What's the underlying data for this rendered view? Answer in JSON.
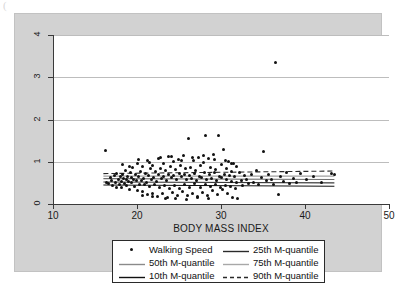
{
  "artifact_glyph": "(",
  "chart_data": {
    "type": "scatter",
    "title": "",
    "xlabel": "BODY MASS INDEX",
    "ylabel": "",
    "xlim": [
      10,
      50
    ],
    "ylim": [
      0,
      4
    ],
    "xticks": [
      10,
      20,
      30,
      40,
      50
    ],
    "yticks": [
      0,
      1,
      2,
      3,
      4
    ],
    "grid": "horizontal",
    "legend_position": "below-axes",
    "series": [
      {
        "name": "Walking Speed",
        "type": "scatter",
        "marker": "circle",
        "color": "#111111",
        "points": [
          [
            16.2,
            1.26
          ],
          [
            16.4,
            0.52
          ],
          [
            16.6,
            0.48
          ],
          [
            16.8,
            0.63
          ],
          [
            17.0,
            0.55
          ],
          [
            17.1,
            0.44
          ],
          [
            17.3,
            0.68
          ],
          [
            17.4,
            0.51
          ],
          [
            17.5,
            0.4
          ],
          [
            17.6,
            0.73
          ],
          [
            17.8,
            0.58
          ],
          [
            17.9,
            0.47
          ],
          [
            18.0,
            0.66
          ],
          [
            18.1,
            0.54
          ],
          [
            18.2,
            0.38
          ],
          [
            18.3,
            0.71
          ],
          [
            18.4,
            0.6
          ],
          [
            18.5,
            0.49
          ],
          [
            18.6,
            0.8
          ],
          [
            18.7,
            0.57
          ],
          [
            18.8,
            0.44
          ],
          [
            18.9,
            0.65
          ],
          [
            19.0,
            0.53
          ],
          [
            19.1,
            0.35
          ],
          [
            19.2,
            0.75
          ],
          [
            19.3,
            0.62
          ],
          [
            19.4,
            0.5
          ],
          [
            19.5,
            0.86
          ],
          [
            19.6,
            0.59
          ],
          [
            19.7,
            0.42
          ],
          [
            19.8,
            0.7
          ],
          [
            19.9,
            0.56
          ],
          [
            20.0,
            0.33
          ],
          [
            20.1,
            0.95
          ],
          [
            20.2,
            0.64
          ],
          [
            20.3,
            0.47
          ],
          [
            20.4,
            0.78
          ],
          [
            20.5,
            0.55
          ],
          [
            20.6,
            0.29
          ],
          [
            20.7,
            0.88
          ],
          [
            20.8,
            0.61
          ],
          [
            20.9,
            0.45
          ],
          [
            21.0,
            0.72
          ],
          [
            21.1,
            0.52
          ],
          [
            21.2,
            0.22
          ],
          [
            21.3,
            1.02
          ],
          [
            21.4,
            0.67
          ],
          [
            21.5,
            0.41
          ],
          [
            21.6,
            0.83
          ],
          [
            21.7,
            0.58
          ],
          [
            21.8,
            0.26
          ],
          [
            21.9,
            0.91
          ],
          [
            22.0,
            0.63
          ],
          [
            22.1,
            0.46
          ],
          [
            22.2,
            0.76
          ],
          [
            22.3,
            0.54
          ],
          [
            22.4,
            0.18
          ],
          [
            22.5,
            1.08
          ],
          [
            22.6,
            0.69
          ],
          [
            22.7,
            0.39
          ],
          [
            22.8,
            0.85
          ],
          [
            22.9,
            0.6
          ],
          [
            23.0,
            0.24
          ],
          [
            23.1,
            0.97
          ],
          [
            23.2,
            0.66
          ],
          [
            23.3,
            0.43
          ],
          [
            23.4,
            0.79
          ],
          [
            23.5,
            0.56
          ],
          [
            23.6,
            0.15
          ],
          [
            23.7,
            1.12
          ],
          [
            23.8,
            0.71
          ],
          [
            23.9,
            0.37
          ],
          [
            24.0,
            0.89
          ],
          [
            24.1,
            0.62
          ],
          [
            24.2,
            0.27
          ],
          [
            24.3,
            1.0
          ],
          [
            24.4,
            0.68
          ],
          [
            24.5,
            0.44
          ],
          [
            24.6,
            0.81
          ],
          [
            24.7,
            0.57
          ],
          [
            24.8,
            0.19
          ],
          [
            24.9,
            1.05
          ],
          [
            25.0,
            0.73
          ],
          [
            25.1,
            0.36
          ],
          [
            25.2,
            0.92
          ],
          [
            25.3,
            0.64
          ],
          [
            25.4,
            0.3
          ],
          [
            25.5,
            1.15
          ],
          [
            25.6,
            0.7
          ],
          [
            25.7,
            0.45
          ],
          [
            25.8,
            0.84
          ],
          [
            25.9,
            0.59
          ],
          [
            26.0,
            0.21
          ],
          [
            26.1,
            1.56
          ],
          [
            26.2,
            0.67
          ],
          [
            26.3,
            0.4
          ],
          [
            26.4,
            0.87
          ],
          [
            26.5,
            0.61
          ],
          [
            26.6,
            0.25
          ],
          [
            26.7,
            1.04
          ],
          [
            26.8,
            0.72
          ],
          [
            26.9,
            0.48
          ],
          [
            27.0,
            0.8
          ],
          [
            27.1,
            0.55
          ],
          [
            27.2,
            0.17
          ],
          [
            27.3,
            1.1
          ],
          [
            27.4,
            0.66
          ],
          [
            27.5,
            0.38
          ],
          [
            27.6,
            0.9
          ],
          [
            27.7,
            0.63
          ],
          [
            27.8,
            0.28
          ],
          [
            27.9,
            0.99
          ],
          [
            28.0,
            0.74
          ],
          [
            28.1,
            0.46
          ],
          [
            28.2,
            1.62
          ],
          [
            28.3,
            0.58
          ],
          [
            28.4,
            0.2
          ],
          [
            28.5,
            1.07
          ],
          [
            28.6,
            0.69
          ],
          [
            28.7,
            0.42
          ],
          [
            28.8,
            0.86
          ],
          [
            28.9,
            0.6
          ],
          [
            29.0,
            0.31
          ],
          [
            29.1,
            1.18
          ],
          [
            29.2,
            0.75
          ],
          [
            29.3,
            0.47
          ],
          [
            29.4,
            0.82
          ],
          [
            29.5,
            0.56
          ],
          [
            29.6,
            0.23
          ],
          [
            29.7,
            1.61
          ],
          [
            29.8,
            0.65
          ],
          [
            29.9,
            0.39
          ],
          [
            30.0,
            0.93
          ],
          [
            30.1,
            0.62
          ],
          [
            30.2,
            0.34
          ],
          [
            30.3,
            1.28
          ],
          [
            30.4,
            0.71
          ],
          [
            30.5,
            0.44
          ],
          [
            30.6,
            0.85
          ],
          [
            30.7,
            0.57
          ],
          [
            30.8,
            0.26
          ],
          [
            30.9,
            1.01
          ],
          [
            31.0,
            0.68
          ],
          [
            31.1,
            0.41
          ],
          [
            31.2,
            0.78
          ],
          [
            31.3,
            0.53
          ],
          [
            31.4,
            0.16
          ],
          [
            31.5,
            0.96
          ],
          [
            31.6,
            0.64
          ],
          [
            31.7,
            0.36
          ],
          [
            31.8,
            0.88
          ],
          [
            31.9,
            0.5
          ],
          [
            32.0,
            0.13
          ],
          [
            32.2,
            0.74
          ],
          [
            32.4,
            0.55
          ],
          [
            32.6,
            0.43
          ],
          [
            32.8,
            0.67
          ],
          [
            33.0,
            0.59
          ],
          [
            33.3,
            0.49
          ],
          [
            33.6,
            0.71
          ],
          [
            33.9,
            0.52
          ],
          [
            34.2,
            0.8
          ],
          [
            34.5,
            0.46
          ],
          [
            34.8,
            0.63
          ],
          [
            35.1,
            1.25
          ],
          [
            35.4,
            0.55
          ],
          [
            35.7,
            0.7
          ],
          [
            36.0,
            0.58
          ],
          [
            36.3,
            0.47
          ],
          [
            36.5,
            3.35
          ],
          [
            36.8,
            0.22
          ],
          [
            37.1,
            0.66
          ],
          [
            37.4,
            0.54
          ],
          [
            37.8,
            0.74
          ],
          [
            38.2,
            0.49
          ],
          [
            38.6,
            0.61
          ],
          [
            39.0,
            0.52
          ],
          [
            39.5,
            0.73
          ],
          [
            40.2,
            0.57
          ],
          [
            41.0,
            0.64
          ],
          [
            42.0,
            0.51
          ],
          [
            43.2,
            0.72
          ],
          [
            43.5,
            0.7
          ],
          [
            18.3,
            0.93
          ],
          [
            19.1,
            0.88
          ],
          [
            20.2,
            1.05
          ],
          [
            21.5,
            0.99
          ],
          [
            22.8,
            1.1
          ],
          [
            24.1,
            1.13
          ],
          [
            25.3,
            1.02
          ],
          [
            26.6,
            1.09
          ],
          [
            27.9,
            1.15
          ],
          [
            29.2,
            1.06
          ],
          [
            30.5,
            1.03
          ],
          [
            31.3,
            0.97
          ],
          [
            23.4,
            0.12
          ],
          [
            24.6,
            0.14
          ],
          [
            25.9,
            0.11
          ],
          [
            27.2,
            0.16
          ],
          [
            28.5,
            0.13
          ],
          [
            21.9,
            0.17
          ],
          [
            20.6,
            0.19
          ]
        ]
      },
      {
        "name": "10th M-quantile",
        "type": "line",
        "style": "solid",
        "color": "#111111",
        "x": [
          16.0,
          43.5
        ],
        "y": [
          0.45,
          0.42
        ]
      },
      {
        "name": "25th M-quantile",
        "type": "line",
        "style": "solid",
        "color": "#3c3c3c",
        "x": [
          16.0,
          43.5
        ],
        "y": [
          0.52,
          0.5
        ]
      },
      {
        "name": "50th M-quantile",
        "type": "line",
        "style": "solid",
        "color": "#6e6e6e",
        "x": [
          16.0,
          43.5
        ],
        "y": [
          0.6,
          0.58
        ]
      },
      {
        "name": "75th M-quantile",
        "type": "line",
        "style": "solid",
        "color": "#a0a0a0",
        "x": [
          16.0,
          43.5
        ],
        "y": [
          0.66,
          0.66
        ]
      },
      {
        "name": "90th M-quantile",
        "type": "line",
        "style": "dashed",
        "color": "#2a2a2a",
        "x": [
          16.0,
          43.5
        ],
        "y": [
          0.72,
          0.78
        ]
      }
    ]
  },
  "legend": {
    "entries": [
      {
        "label": "Walking Speed",
        "key": "marker",
        "style": "dot",
        "color": "#111111"
      },
      {
        "label": "25th M-quantile",
        "key": "line",
        "style": "solid",
        "color": "#2a2a2a"
      },
      {
        "label": "50th M-quantile",
        "key": "line",
        "style": "solid",
        "color": "#8a8a8a"
      },
      {
        "label": "75th M-quantile",
        "key": "line",
        "style": "solid",
        "color": "#a8a8a8"
      },
      {
        "label": "10th M-quantile",
        "key": "line",
        "style": "solid",
        "color": "#111111"
      },
      {
        "label": "90th M-quantile",
        "key": "line",
        "style": "dashed",
        "color": "#2a2a2a"
      }
    ]
  },
  "colors": {
    "plate_background": "#d2d2d2",
    "panel_background": "#ffffff",
    "axis": "#3a3a3a",
    "grid": "#bdbdbd",
    "text": "#1a1a1a"
  }
}
